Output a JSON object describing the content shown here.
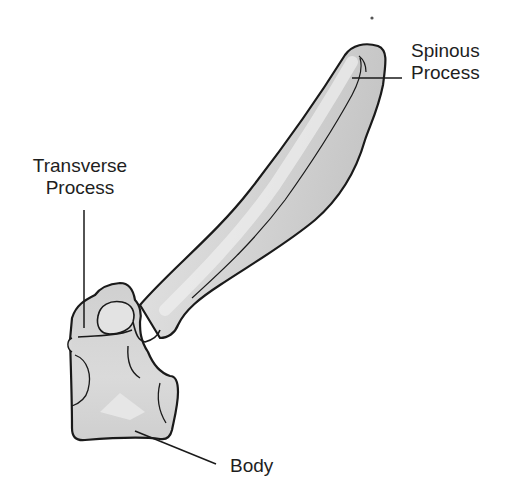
{
  "diagram": {
    "labels": {
      "spinous_process": {
        "line1": "Spinous",
        "line2": "Process"
      },
      "transverse_process": {
        "line1": "Transverse",
        "line2": "Process"
      },
      "body": {
        "text": "Body"
      }
    },
    "colors": {
      "background": "#ffffff",
      "bone_fill": "#d9d9d9",
      "bone_highlight": "#ececec",
      "bone_shadow": "#bdbdbd",
      "outline": "#1a1a1a",
      "leader_line": "#1a1a1a",
      "label_text": "#1e1e1e"
    }
  }
}
